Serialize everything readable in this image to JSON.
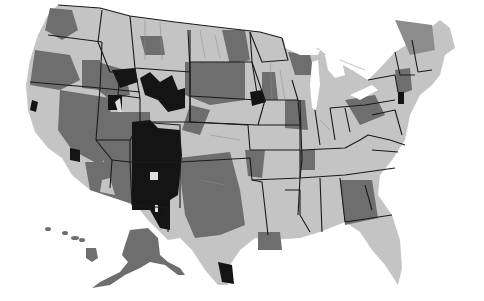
{
  "map": {
    "type": "choropleth",
    "region": "United States (including Alaska and Hawaii insets)",
    "style": "grayscale",
    "legend_visible": false,
    "shade_levels": [
      {
        "name": "light",
        "color": "#c4c4c4"
      },
      {
        "name": "medium",
        "color": "#6e6e6e"
      },
      {
        "name": "dark",
        "color": "#141414"
      },
      {
        "name": "none",
        "color": "#f2f2f2"
      }
    ],
    "border_color": "#1a1a1a",
    "background": "#ffffff",
    "highlighted_dark_areas": [
      "Western New Mexico / eastern Arizona",
      "Southwest Colorado",
      "Central Wyoming",
      "Southern Idaho / Yellowstone",
      "Eastern South Dakota / Minnesota border",
      "South Texas tip",
      "Southern California"
    ]
  }
}
